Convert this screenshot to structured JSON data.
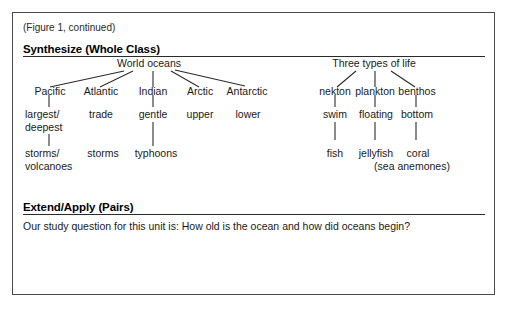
{
  "figure": {
    "caption": "(Figure 1, continued)"
  },
  "sections": {
    "synthesize": {
      "heading": "Synthesize (Whole Class)"
    },
    "extend": {
      "heading": "Extend/Apply (Pairs)",
      "body": "Our study question for this unit is: How old is the ocean and how did oceans begin?"
    }
  },
  "concept_map": {
    "left_tree": {
      "root": "World oceans",
      "level1": [
        "Pacific",
        "Atlantic",
        "Indian",
        "Arctic",
        "Antarctic"
      ],
      "level2": [
        "largest/",
        "deepest",
        "trade",
        "gentle",
        "upper",
        "lower"
      ],
      "level2_pacific_line1": "largest/",
      "level2_pacific_line2": "deepest",
      "level2_atlantic": "trade",
      "level2_indian": "gentle",
      "level2_arctic": "upper",
      "level2_antarctic": "lower",
      "level3_pacific_line1": "storms/",
      "level3_pacific_line2": "volcanoes",
      "level3_atlantic": "storms",
      "level3_indian": "typhoons"
    },
    "right_tree": {
      "root": "Three types of life",
      "level1": [
        "nekton",
        "plankton",
        "benthos"
      ],
      "level2": [
        "swim",
        "floating",
        "bottom"
      ],
      "level3": [
        "fish",
        "jellyfish",
        "coral"
      ],
      "level3_note": "(sea anemones)"
    }
  },
  "colors": {
    "border": "#4a4a4a",
    "rule": "#2b2b2b",
    "text": "#1a1a1a",
    "background": "#ffffff"
  }
}
